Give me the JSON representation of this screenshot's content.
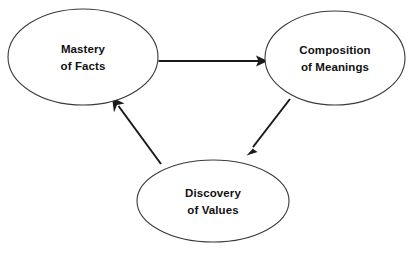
{
  "diagram": {
    "background_color": "#ffffff",
    "node_stroke_color": "#3a3a3a",
    "edge_color": "#1a1a1a",
    "text_color": "#111111",
    "nodes": [
      {
        "id": "mastery-of-facts",
        "line1": "Mastery",
        "line2": "of Facts",
        "cx": 83,
        "cy": 57,
        "rx": 75,
        "ry": 48
      },
      {
        "id": "composition-of-meanings",
        "line1": "Composition",
        "line2": "of Meanings",
        "cx": 335,
        "cy": 58,
        "rx": 70,
        "ry": 47
      },
      {
        "id": "discovery-of-values",
        "line1": "Discovery",
        "line2": "of Values",
        "cx": 213,
        "cy": 201,
        "rx": 76,
        "ry": 41
      }
    ],
    "edges": [
      {
        "id": "facts-to-meanings",
        "from": "mastery-of-facts",
        "to": "composition-of-meanings",
        "label": ""
      },
      {
        "id": "meanings-to-values",
        "from": "composition-of-meanings",
        "to": "discovery-of-values",
        "label": ""
      },
      {
        "id": "values-to-facts",
        "from": "discovery-of-values",
        "to": "mastery-of-facts",
        "label": ""
      }
    ]
  }
}
